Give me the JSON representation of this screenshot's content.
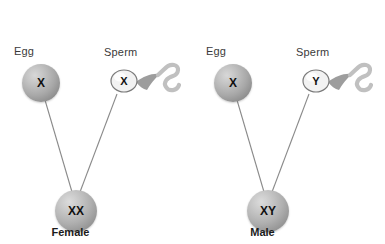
{
  "diagram": {
    "background_color": "#ffffff",
    "line_color": "#808080",
    "text_color": "#3a3a3a"
  },
  "panels": [
    {
      "id": "female-cross",
      "egg": {
        "caption": "Egg",
        "chromosome": "X"
      },
      "sperm": {
        "caption": "Sperm",
        "chromosome": "X"
      },
      "zygote": {
        "chromosomes": "XX",
        "result_label": "Female"
      }
    },
    {
      "id": "male-cross",
      "egg": {
        "caption": "Egg",
        "chromosome": "X"
      },
      "sperm": {
        "caption": "Sperm",
        "chromosome": "Y"
      },
      "zygote": {
        "chromosomes": "XY",
        "result_label": "Male"
      }
    }
  ]
}
